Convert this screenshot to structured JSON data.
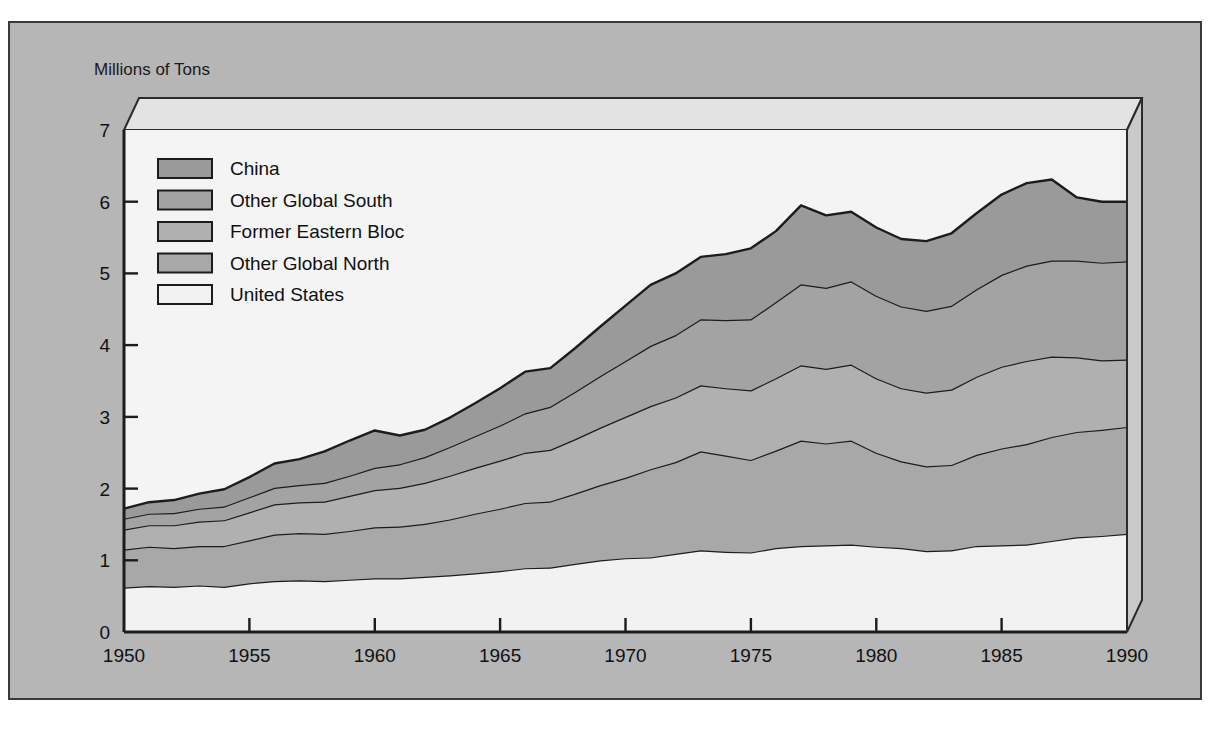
{
  "figure": {
    "background_color": "#b6b6b6",
    "plot_background_color": "#f4f4f4",
    "border_color": "#3a3a3a"
  },
  "axis": {
    "y_title": "Millions of Tons",
    "y_ticks": [
      "0",
      "1",
      "2",
      "3",
      "4",
      "5",
      "6",
      "7"
    ],
    "x_ticks": [
      "1950",
      "1955",
      "1960",
      "1965",
      "1970",
      "1975",
      "1980",
      "1985",
      "1990"
    ]
  },
  "legend": {
    "items": [
      {
        "label": "China",
        "color": "#9a9a9a"
      },
      {
        "label": "Other Global South",
        "color": "#a3a3a3"
      },
      {
        "label": "Former Eastern Bloc",
        "color": "#b0b0b0"
      },
      {
        "label": "Other Global North",
        "color": "#a8a8a8"
      },
      {
        "label": "United States",
        "color": "#f2f2f2"
      }
    ]
  },
  "chart_data": {
    "type": "area",
    "title": "",
    "subtitle": "",
    "xlabel": "",
    "ylabel": "Millions of Tons",
    "xlim": [
      1950,
      1990
    ],
    "ylim": [
      0,
      7
    ],
    "grid": false,
    "legend_position": "inside-top-left",
    "stacked": true,
    "stack_order_bottom_to_top": [
      "United States",
      "Other Global North",
      "Former Eastern Bloc",
      "Other Global South",
      "China"
    ],
    "x": [
      1950,
      1951,
      1952,
      1953,
      1954,
      1955,
      1956,
      1957,
      1958,
      1959,
      1960,
      1961,
      1962,
      1963,
      1964,
      1965,
      1966,
      1967,
      1968,
      1969,
      1970,
      1971,
      1972,
      1973,
      1974,
      1975,
      1976,
      1977,
      1978,
      1979,
      1980,
      1981,
      1982,
      1983,
      1984,
      1985,
      1986,
      1987,
      1988,
      1989,
      1990
    ],
    "series": [
      {
        "name": "United States",
        "values": [
          0.62,
          0.64,
          0.63,
          0.65,
          0.63,
          0.68,
          0.71,
          0.72,
          0.71,
          0.73,
          0.75,
          0.75,
          0.77,
          0.79,
          0.82,
          0.85,
          0.89,
          0.9,
          0.95,
          1.0,
          1.03,
          1.04,
          1.09,
          1.14,
          1.12,
          1.11,
          1.17,
          1.2,
          1.21,
          1.22,
          1.19,
          1.17,
          1.13,
          1.14,
          1.2,
          1.21,
          1.22,
          1.27,
          1.32,
          1.34,
          1.37
        ]
      },
      {
        "name": "Other Global North",
        "values": [
          0.53,
          0.55,
          0.54,
          0.55,
          0.57,
          0.6,
          0.65,
          0.66,
          0.66,
          0.68,
          0.71,
          0.72,
          0.74,
          0.78,
          0.83,
          0.87,
          0.91,
          0.92,
          0.98,
          1.05,
          1.12,
          1.23,
          1.28,
          1.38,
          1.34,
          1.29,
          1.36,
          1.47,
          1.42,
          1.45,
          1.31,
          1.21,
          1.18,
          1.19,
          1.27,
          1.35,
          1.4,
          1.45,
          1.47,
          1.48,
          1.49
        ]
      },
      {
        "name": "Former Eastern Bloc",
        "values": [
          0.28,
          0.3,
          0.32,
          0.34,
          0.36,
          0.39,
          0.42,
          0.43,
          0.45,
          0.49,
          0.52,
          0.54,
          0.57,
          0.61,
          0.64,
          0.67,
          0.7,
          0.72,
          0.76,
          0.8,
          0.85,
          0.88,
          0.9,
          0.92,
          0.94,
          0.97,
          1.01,
          1.05,
          1.04,
          1.06,
          1.04,
          1.02,
          1.03,
          1.05,
          1.09,
          1.14,
          1.16,
          1.12,
          1.04,
          0.97,
          0.94
        ]
      },
      {
        "name": "Other Global South",
        "values": [
          0.15,
          0.16,
          0.17,
          0.18,
          0.19,
          0.21,
          0.23,
          0.24,
          0.26,
          0.28,
          0.31,
          0.33,
          0.36,
          0.4,
          0.44,
          0.49,
          0.55,
          0.6,
          0.66,
          0.72,
          0.78,
          0.84,
          0.87,
          0.92,
          0.95,
          0.99,
          1.06,
          1.13,
          1.13,
          1.16,
          1.15,
          1.14,
          1.14,
          1.17,
          1.22,
          1.28,
          1.33,
          1.34,
          1.35,
          1.36,
          1.37
        ]
      },
      {
        "name": "China",
        "values": [
          0.14,
          0.16,
          0.18,
          0.21,
          0.24,
          0.28,
          0.34,
          0.36,
          0.44,
          0.49,
          0.52,
          0.4,
          0.38,
          0.41,
          0.46,
          0.52,
          0.58,
          0.54,
          0.61,
          0.69,
          0.77,
          0.85,
          0.86,
          0.87,
          0.92,
          0.99,
          0.99,
          1.1,
          1.01,
          0.97,
          0.95,
          0.94,
          0.97,
          1.01,
          1.06,
          1.12,
          1.15,
          1.13,
          0.88,
          0.85,
          0.83
        ]
      }
    ]
  }
}
